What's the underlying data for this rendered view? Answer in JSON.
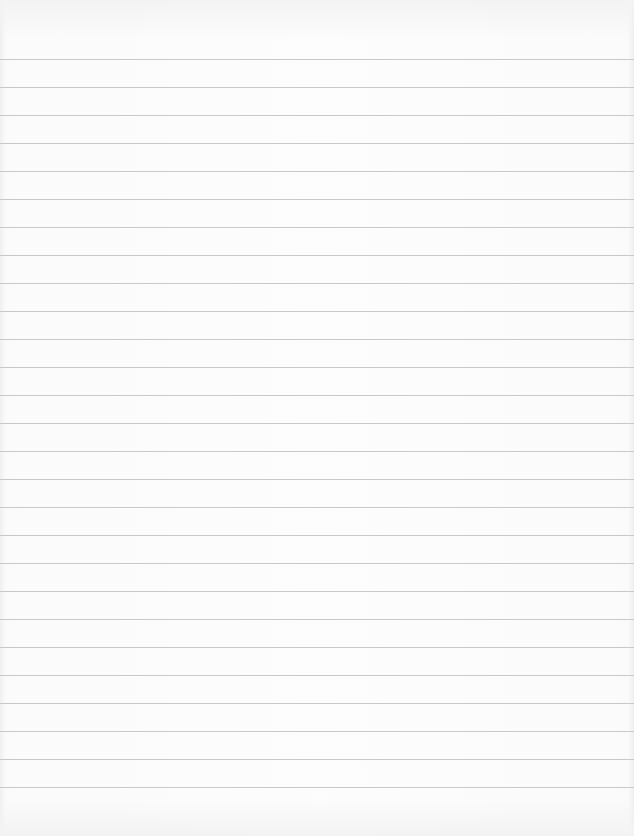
{
  "image": {
    "subject": "blank lined notebook paper",
    "background_color": "#fcfcfc",
    "rule_color": "#c9c9c9",
    "rules": {
      "count": 27,
      "first_y": 59,
      "spacing": 28,
      "last_y": 787
    }
  }
}
